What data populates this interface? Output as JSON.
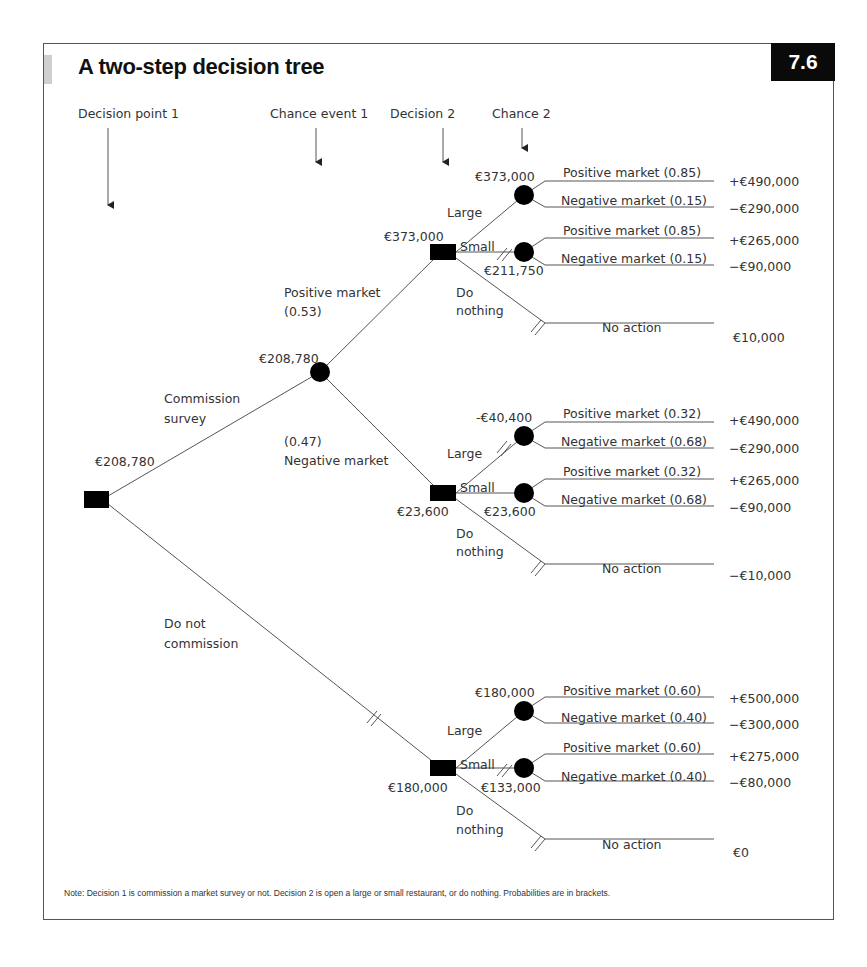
{
  "figure": {
    "title": "A two-step decision tree",
    "number": "7.6",
    "note": "Note: Decision 1 is commission a market survey or not. Decision 2 is open a large or small restaurant, or do nothing. Probabilities are in brackets."
  },
  "stage_headers": [
    {
      "label": "Decision point 1"
    },
    {
      "label": "Chance event 1"
    },
    {
      "label": "Decision 2"
    },
    {
      "label": "Chance 2"
    }
  ],
  "root": {
    "value": "€208,780",
    "branches": {
      "commission": "Commission survey",
      "commission_l1": "Commission",
      "commission_l2": "survey",
      "no_commission_l1": "Do not",
      "no_commission_l2": "commission"
    }
  },
  "chance1": {
    "value": "€208,780",
    "positive_l1": "Positive market",
    "positive_l2": "(0.53)",
    "negative_l1": "(0.47)",
    "negative_l2": "Negative market"
  },
  "subtrees": [
    {
      "decision_value": "€373,000",
      "large_label": "Large",
      "small_label": "Small",
      "nothing_l1": "Do",
      "nothing_l2": "nothing",
      "large_ev": "€373,000",
      "small_ev": "€211,750",
      "large_outcomes": [
        {
          "label": "Positive market (0.85)",
          "payoff": "+€490,000"
        },
        {
          "label": "Negative market (0.15)",
          "payoff": "−€290,000"
        }
      ],
      "small_outcomes": [
        {
          "label": "Positive market (0.85)",
          "payoff": "+€265,000"
        },
        {
          "label": "Negative market (0.15)",
          "payoff": "−€90,000"
        }
      ],
      "no_action": {
        "label": "No action",
        "payoff": "€10,000"
      }
    },
    {
      "decision_value": "€23,600",
      "large_label": "Large",
      "small_label": "Small",
      "nothing_l1": "Do",
      "nothing_l2": "nothing",
      "large_ev": "-€40,400",
      "small_ev": "€23,600",
      "large_outcomes": [
        {
          "label": "Positive market (0.32)",
          "payoff": "+€490,000"
        },
        {
          "label": "Negative market (0.68)",
          "payoff": "−€290,000"
        }
      ],
      "small_outcomes": [
        {
          "label": "Positive market (0.32)",
          "payoff": "+€265,000"
        },
        {
          "label": "Negative market (0.68)",
          "payoff": "−€90,000"
        }
      ],
      "no_action": {
        "label": "No action",
        "payoff": "−€10,000"
      }
    },
    {
      "decision_value": "€180,000",
      "large_label": "Large",
      "small_label": "Small",
      "nothing_l1": "Do",
      "nothing_l2": "nothing",
      "large_ev": "€180,000",
      "small_ev": "€133,000",
      "large_outcomes": [
        {
          "label": "Positive market (0.60)",
          "payoff": "+€500,000"
        },
        {
          "label": "Negative market (0.40)",
          "payoff": "−€300,000"
        }
      ],
      "small_outcomes": [
        {
          "label": "Positive market (0.60)",
          "payoff": "+€275,000"
        },
        {
          "label": "Negative market (0.40)",
          "payoff": "−€80,000"
        }
      ],
      "no_action": {
        "label": "No action",
        "payoff": "€0"
      }
    }
  ],
  "colors": {
    "line": "#555555",
    "node": "#000000",
    "text": "#333333",
    "badge_bg": "#0a0a0a"
  }
}
